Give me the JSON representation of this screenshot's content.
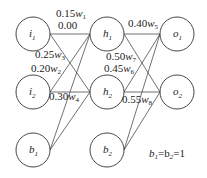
{
  "nodes": [
    {
      "id": "i1",
      "label": "i",
      "sub": "1",
      "x": 33,
      "y": 34
    },
    {
      "id": "i2",
      "label": "i",
      "sub": "2",
      "x": 33,
      "y": 92
    },
    {
      "id": "b1",
      "label": "b",
      "sub": "1",
      "x": 33,
      "y": 150
    },
    {
      "id": "h1",
      "label": "h",
      "sub": "1",
      "x": 107,
      "y": 34
    },
    {
      "id": "h2",
      "label": "h",
      "sub": "2",
      "x": 107,
      "y": 92
    },
    {
      "id": "b2",
      "label": "b",
      "sub": "2",
      "x": 107,
      "y": 150
    },
    {
      "id": "o1",
      "label": "o",
      "sub": "1",
      "x": 177,
      "y": 34
    },
    {
      "id": "o2",
      "label": "o",
      "sub": "2",
      "x": 177,
      "y": 92
    }
  ],
  "edges": [
    [
      "i1",
      "h1"
    ],
    [
      "i1",
      "h2"
    ],
    [
      "i2",
      "h1"
    ],
    [
      "i2",
      "h2"
    ],
    [
      "b1",
      "h1"
    ],
    [
      "b1",
      "h2"
    ],
    [
      "h1",
      "o1"
    ],
    [
      "h1",
      "o2"
    ],
    [
      "h2",
      "o1"
    ],
    [
      "h2",
      "o2"
    ],
    [
      "b2",
      "o1"
    ],
    [
      "b2",
      "o2"
    ]
  ],
  "weights": [
    {
      "value": "0.15",
      "w": "w",
      "sub": "1",
      "x": 56,
      "y": 17
    },
    {
      "value": "0.00",
      "w": "",
      "sub": "",
      "x": 58,
      "y": 29
    },
    {
      "value": "0.25",
      "w": "w",
      "sub": "3",
      "x": 35,
      "y": 58
    },
    {
      "value": "0.20",
      "w": "w",
      "sub": "2",
      "x": 31,
      "y": 72
    },
    {
      "value": "0.30",
      "w": "w",
      "sub": "4",
      "x": 49,
      "y": 100
    },
    {
      "value": "0.40",
      "w": "w",
      "sub": "5",
      "x": 128,
      "y": 27
    },
    {
      "value": "0.50",
      "w": "w",
      "sub": "7",
      "x": 106,
      "y": 60
    },
    {
      "value": "0.45",
      "w": "w",
      "sub": "6",
      "x": 104,
      "y": 72
    },
    {
      "value": "0.55",
      "w": "w",
      "sub": "8",
      "x": 122,
      "y": 103
    }
  ],
  "note": {
    "text": "b1=b2=1",
    "x": 149,
    "y": 157
  }
}
